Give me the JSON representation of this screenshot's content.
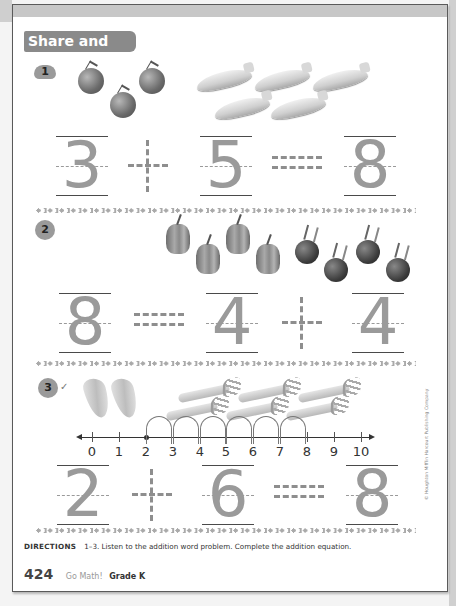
{
  "section_title": "Share and Show",
  "problems": [
    {
      "number": "1",
      "badge_shape": "car-icon",
      "objects": [
        {
          "type": "tomato",
          "count": 3
        },
        {
          "type": "zucchini",
          "count": 5
        }
      ],
      "equation": {
        "a": "3",
        "op1": "+",
        "b": "5",
        "op2": "=",
        "c": "8"
      }
    },
    {
      "number": "2",
      "badge_shape": "circle",
      "objects": [
        {
          "type": "bell-pepper",
          "count": 4
        },
        {
          "type": "beet",
          "count": 4
        }
      ],
      "equation": {
        "a": "8",
        "op1": "=",
        "b": "4",
        "op2": "+",
        "c": "4"
      }
    },
    {
      "number": "3",
      "badge_shape": "tree-icon",
      "check_mark": "✓",
      "objects": [
        {
          "type": "onion",
          "count": 2
        },
        {
          "type": "leek",
          "count": 6
        }
      ],
      "number_line": {
        "ticks": [
          "0",
          "1",
          "2",
          "3",
          "4",
          "5",
          "6",
          "7",
          "8",
          "9",
          "10"
        ],
        "start": 2,
        "hops": 6,
        "end": 8
      },
      "equation": {
        "a": "2",
        "op1": "+",
        "b": "6",
        "op2": "=",
        "c": "8"
      }
    }
  ],
  "directions": {
    "label": "DIRECTIONS",
    "text": "1–3. Listen to the addition word problem. Complete the addition equation."
  },
  "footer": {
    "page_number": "424",
    "brand": "Go Math!",
    "grade": "Grade K"
  },
  "copyright": "© Houghton Mifflin Harcourt Publishing Company"
}
